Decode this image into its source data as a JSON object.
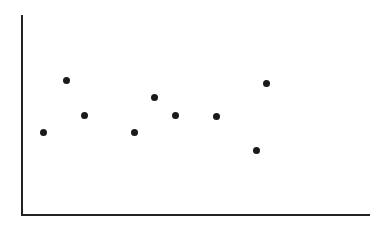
{
  "chart_data": {
    "type": "scatter",
    "title": "",
    "subtitle": "",
    "xlabel": "",
    "ylabel": "",
    "xlim": [
      0,
      100
    ],
    "ylim": [
      0,
      100
    ],
    "grid": false,
    "legend": null,
    "xticks": [],
    "yticks": [],
    "xtick_labels": [],
    "ytick_labels": [],
    "annotations": [],
    "series": [
      {
        "name": "series-1",
        "marker": "circle",
        "marker_color": "#1a1a1a",
        "marker_size": 7,
        "x": [
          6.2,
          12.6,
          18.0,
          32.3,
          38.1,
          44.0,
          55.9,
          67.4,
          70.3
        ],
        "y": [
          42.2,
          68.0,
          51.0,
          42.2,
          59.8,
          51.0,
          50.5,
          33.2,
          67.2
        ],
        "points": [
          {
            "x": 6.2,
            "y": 42.2,
            "px": 43.5,
            "py": 132.0
          },
          {
            "x": 12.6,
            "y": 68.0,
            "px": 66.0,
            "py": 80.5
          },
          {
            "x": 18.0,
            "y": 51.0,
            "px": 84.5,
            "py": 115.0
          },
          {
            "x": 32.3,
            "y": 42.2,
            "px": 134.0,
            "py": 132.0
          },
          {
            "x": 38.1,
            "y": 59.8,
            "px": 154.5,
            "py": 97.0
          },
          {
            "x": 44.0,
            "y": 51.0,
            "px": 175.0,
            "py": 115.0
          },
          {
            "x": 55.9,
            "y": 50.5,
            "px": 216.5,
            "py": 116.0
          },
          {
            "x": 67.4,
            "y": 33.2,
            "px": 256.5,
            "py": 150.5
          },
          {
            "x": 70.3,
            "y": 67.2,
            "px": 266.5,
            "py": 83.0
          }
        ]
      }
    ],
    "axes": {
      "x_axis": {
        "x1": 21,
        "y1": 215,
        "x2": 370,
        "y2": 215,
        "color": "#222222",
        "width": 2
      },
      "y_axis": {
        "x1": 22,
        "y1": 15,
        "x2": 22,
        "y2": 216,
        "color": "#222222",
        "width": 2
      }
    },
    "colors": {
      "background": "#ffffff",
      "axis": "#222222",
      "marker": "#1a1a1a"
    }
  }
}
